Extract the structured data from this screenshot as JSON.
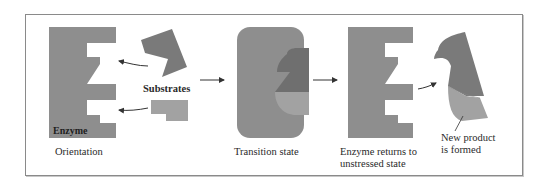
{
  "figure": {
    "colors": {
      "enzyme": "#8e8e8e",
      "substrate_a": "#7a7a7a",
      "substrate_b": "#a2a2a2",
      "frame": "#8a8a8a",
      "arrow": "#333333"
    },
    "panels": [
      {
        "id": "orientation",
        "caption": "Orientation"
      },
      {
        "id": "transition",
        "caption": "Transition state"
      },
      {
        "id": "release",
        "caption_line1": "Enzyme returns to",
        "caption_line2": "unstressed state"
      }
    ],
    "labels": {
      "enzyme": "Enzyme",
      "substrates": "Substrates",
      "product_line1": "New product",
      "product_line2": "is formed"
    }
  }
}
